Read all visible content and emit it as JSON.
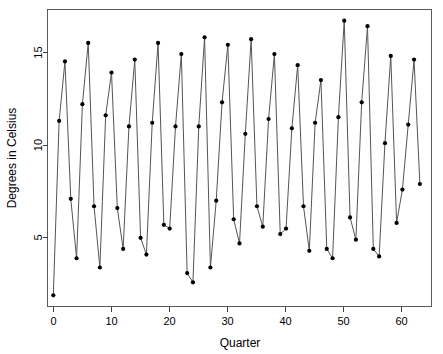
{
  "chart_data": {
    "type": "line",
    "title": "",
    "xlabel": "Quarter",
    "ylabel": "Degrees in Celsius",
    "xlim": [
      0,
      66
    ],
    "ylim": [
      1.2,
      17.2
    ],
    "grid": false,
    "legend": null,
    "marker": "filled-circle",
    "line_color": "#555555",
    "marker_color": "#000000",
    "xticks": [
      0,
      10,
      20,
      30,
      40,
      50,
      60
    ],
    "xtick_labels": [
      "0",
      "10",
      "20",
      "30",
      "40",
      "50",
      "60"
    ],
    "yticks": [
      5,
      10,
      15
    ],
    "ytick_labels": [
      "5",
      "10",
      "15"
    ],
    "x": [
      1,
      2,
      3,
      4,
      5,
      6,
      7,
      8,
      9,
      10,
      11,
      12,
      13,
      14,
      15,
      16,
      17,
      18,
      19,
      20,
      21,
      22,
      23,
      24,
      25,
      26,
      27,
      28,
      29,
      30,
      31,
      32,
      33,
      34,
      35,
      36,
      37,
      38,
      39,
      40,
      41,
      42,
      43,
      44,
      45,
      46,
      47,
      48,
      49,
      50,
      51,
      52,
      53,
      54,
      55,
      56,
      57,
      58,
      59,
      60,
      61,
      62,
      63,
      64
    ],
    "values": [
      1.8,
      11.2,
      14.4,
      7.0,
      3.8,
      12.1,
      15.4,
      6.6,
      3.3,
      11.5,
      13.8,
      6.5,
      4.3,
      10.9,
      14.5,
      4.9,
      4.0,
      11.1,
      15.4,
      5.6,
      5.4,
      10.9,
      14.8,
      3.0,
      2.5,
      10.9,
      15.7,
      3.3,
      6.9,
      12.2,
      15.3,
      5.9,
      4.6,
      10.5,
      15.6,
      6.6,
      5.5,
      11.3,
      14.8,
      5.1,
      5.4,
      10.8,
      14.2,
      6.6,
      4.2,
      11.1,
      13.4,
      4.3,
      3.8,
      11.4,
      16.6,
      6.0,
      4.8,
      12.2,
      16.3,
      4.3,
      3.9,
      10.0,
      14.7,
      5.7,
      7.5,
      11.0,
      14.5,
      7.8
    ],
    "series_name": "Quarterly mean temperature"
  },
  "axes": {
    "y_title": "Degrees in Celsius",
    "x_title": "Quarter"
  }
}
